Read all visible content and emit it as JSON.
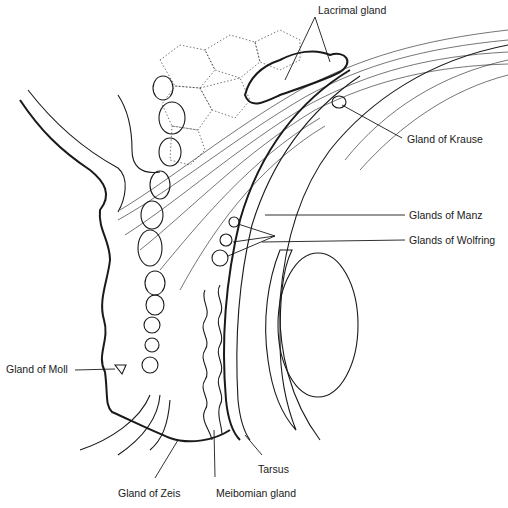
{
  "diagram": {
    "labels": {
      "lacrimal_gland": "Lacrimal gland",
      "gland_of_krause": "Gland of Krause",
      "glands_of_manz": "Glands of Manz",
      "glands_of_wolfring": "Glands of Wolfring",
      "gland_of_moll": "Gland of Moll",
      "tarsus": "Tarsus",
      "gland_of_zeis": "Gland of Zeis",
      "meibomian_gland": "Meibomian gland"
    },
    "colors": {
      "ink": "#1a1a1a",
      "background": "#ffffff"
    }
  }
}
